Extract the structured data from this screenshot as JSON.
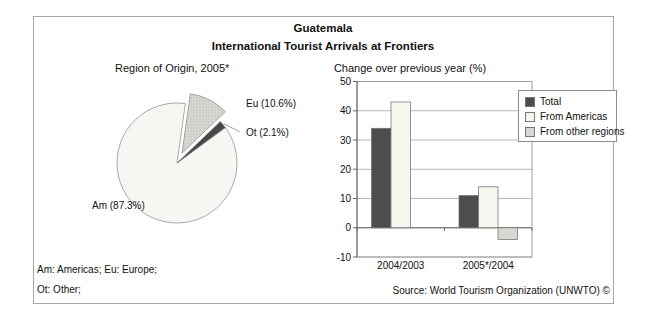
{
  "header": {
    "title": "Guatemala",
    "subtitle": "International Tourist Arrivals at Frontiers"
  },
  "footer": {
    "notes_line1": "Am: Americas; Eu: Europe;",
    "notes_line2": "Ot: Other;",
    "source": "Source: World Tourism Organization (UNWTO) ©"
  },
  "colors": {
    "box_border": "#a8a8a8",
    "grid": "#b8b8b8",
    "frame": "#9e9e9e",
    "axis": "#666666",
    "bar_stroke": "#737373",
    "pie_stroke": "#8c8c8c",
    "text": "#111111"
  },
  "chart_data": [
    {
      "type": "pie",
      "title": "Region of Origin, 2005*",
      "start_angle_deg": 8,
      "direction": "clockwise",
      "slices": [
        {
          "id": "Eu",
          "label": "Eu (10.6%)",
          "name": "Europe",
          "value": 10.6,
          "color": "#d8d8d2",
          "exploded": true,
          "pattern": "dots"
        },
        {
          "id": "Ot",
          "label": "Ot (2.1%)",
          "name": "Other",
          "value": 2.1,
          "color": "#474747",
          "exploded": false,
          "pattern": "solid"
        },
        {
          "id": "Am",
          "label": "Am (87.3%)",
          "name": "Americas",
          "value": 87.3,
          "color": "#f6f6f2",
          "exploded": false,
          "pattern": "solid"
        }
      ]
    },
    {
      "type": "bar",
      "title": "Change over previous year (%)",
      "categories": [
        "2004/2003",
        "2005*/2004"
      ],
      "series": [
        {
          "name": "Total",
          "values": [
            34,
            11
          ],
          "color": "#4d4d4d"
        },
        {
          "name": "From Americas",
          "values": [
            43,
            14
          ],
          "color": "#f6f6f1"
        },
        {
          "name": "From other regions",
          "values": [
            0,
            -4
          ],
          "color": "#d8d8d2"
        }
      ],
      "ylim": [
        -10,
        50
      ],
      "ytick_step": 10,
      "grid": true,
      "legend_position": "top-right"
    }
  ]
}
